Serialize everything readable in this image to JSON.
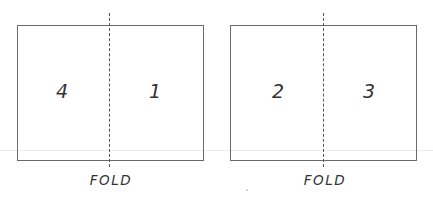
{
  "diagram": {
    "sheets": [
      {
        "name": "left-sheet",
        "pages": [
          {
            "position": "left",
            "label": "4"
          },
          {
            "position": "right",
            "label": "1"
          }
        ],
        "fold_label": "FOLD"
      },
      {
        "name": "right-sheet",
        "pages": [
          {
            "position": "left",
            "label": "2"
          },
          {
            "position": "right",
            "label": "3"
          }
        ],
        "fold_label": "FOLD"
      }
    ]
  }
}
